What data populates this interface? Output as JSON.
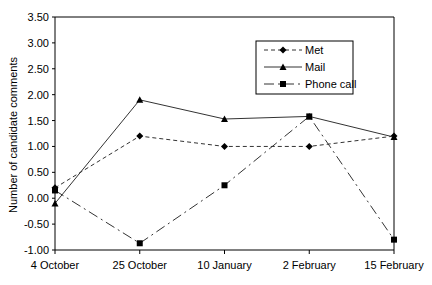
{
  "chart_data": {
    "type": "line",
    "title": "",
    "xlabel": "",
    "ylabel": "Number of candidate comments",
    "categories": [
      "4 October",
      "25 October",
      "10 January",
      "2 February",
      "15 February"
    ],
    "ylim": [
      -1.0,
      3.5
    ],
    "yticks": [
      "3.50",
      "3.00",
      "2.50",
      "2.00",
      "1.50",
      "1.00",
      "0.50",
      "0.00",
      "-0.50",
      "-1.00"
    ],
    "grid": false,
    "legend_position": "upper right, inside plot",
    "series": [
      {
        "name": "Met",
        "values": [
          0.2,
          1.2,
          1.0,
          1.0,
          1.2
        ],
        "line": "dashed",
        "marker": "diamond"
      },
      {
        "name": "Mail",
        "values": [
          -0.1,
          1.9,
          1.53,
          1.58,
          1.18
        ],
        "line": "solid",
        "marker": "triangle"
      },
      {
        "name": "Phone call",
        "values": [
          0.15,
          -0.87,
          0.25,
          1.58,
          -0.8
        ],
        "line": "dash-dot",
        "marker": "square"
      }
    ]
  }
}
